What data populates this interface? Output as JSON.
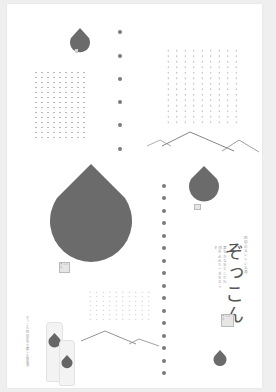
{
  "poster": {
    "headline": "ぞっこん",
    "subtitle_vertical": "四国のおいしいお酒",
    "body_vertical_1": "清らかな水とこだわり",
    "body_vertical_2": "心を込めた一本をどうぞ",
    "left_vertical_text": "ぞっこん 四国の水で醸した純米酒",
    "stamp_text": "ぞっこん",
    "colors": {
      "background": "#efefef",
      "paper": "#ffffff",
      "drop": "#6b6b6b",
      "dots": "#7a7a7a",
      "grid_dots": "#b8b8b8",
      "mountain": "#8a8a8a",
      "text": "#555555"
    },
    "elements": {
      "drops": [
        "small-drop-top",
        "large-drop-center",
        "medium-drop-right",
        "small-drop-bottom"
      ],
      "dot_columns": [
        "top-center-column",
        "middle-right-column"
      ],
      "dot_grids": [
        "top-left-grid",
        "top-right-grid",
        "bottom-center-grid"
      ],
      "mountains": [
        "upper-mountain-line",
        "lower-mountain-line"
      ],
      "product": "sake-bottles"
    }
  }
}
